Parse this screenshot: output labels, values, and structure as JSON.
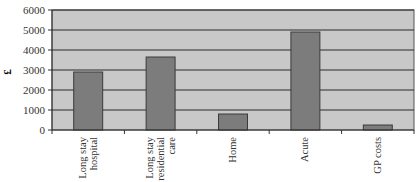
{
  "chart_data": {
    "type": "bar",
    "title": "",
    "xlabel": "",
    "ylabel": "£",
    "ylim": [
      0,
      6000
    ],
    "yticks": [
      0,
      1000,
      2000,
      3000,
      4000,
      5000,
      6000
    ],
    "grid": true,
    "legend": null,
    "categories": [
      "Long stay hospital",
      "Long stay residential care",
      "Home",
      "Acute",
      "GP costs"
    ],
    "category_lines": [
      [
        "Long stay",
        "hospital"
      ],
      [
        "Long stay",
        "residential",
        "care"
      ],
      [
        "Home"
      ],
      [
        "Acute"
      ],
      [
        "GP costs"
      ]
    ],
    "values": [
      2900,
      3650,
      800,
      4900,
      250
    ],
    "colors": {
      "plot_bg": "#c8c8c8",
      "bar_fill": "#7c7c7c",
      "bar_stroke": "#3a3a3a",
      "grid": "#2a2a2a"
    }
  }
}
